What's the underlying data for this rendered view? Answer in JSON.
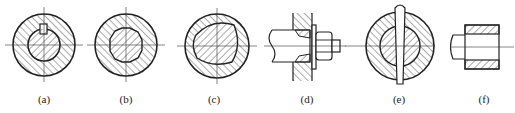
{
  "diagram": {
    "panels": [
      {
        "id": "a",
        "label": "(a)",
        "content": "circular hub cross-section with round shaft and key"
      },
      {
        "id": "b",
        "label": "(b)",
        "content": "circular hub cross-section with splined (hexagonal-like) shaft"
      },
      {
        "id": "c",
        "label": "(c)",
        "content": "circular hub cross-section with rounded triangular profile shaft"
      },
      {
        "id": "d",
        "label": "(d)",
        "content": "side section of shaft clamped in plate with tapered sleeve, washer and nut"
      },
      {
        "id": "e",
        "label": "(e)",
        "content": "circular hub cross-section with transverse pin through shaft"
      },
      {
        "id": "f",
        "label": "(f)",
        "content": "side section of shaft fitted into hub (interference fit)"
      }
    ]
  },
  "colors": {
    "stroke": "#222222",
    "hatch": "#444444",
    "background": "#ffffff"
  }
}
